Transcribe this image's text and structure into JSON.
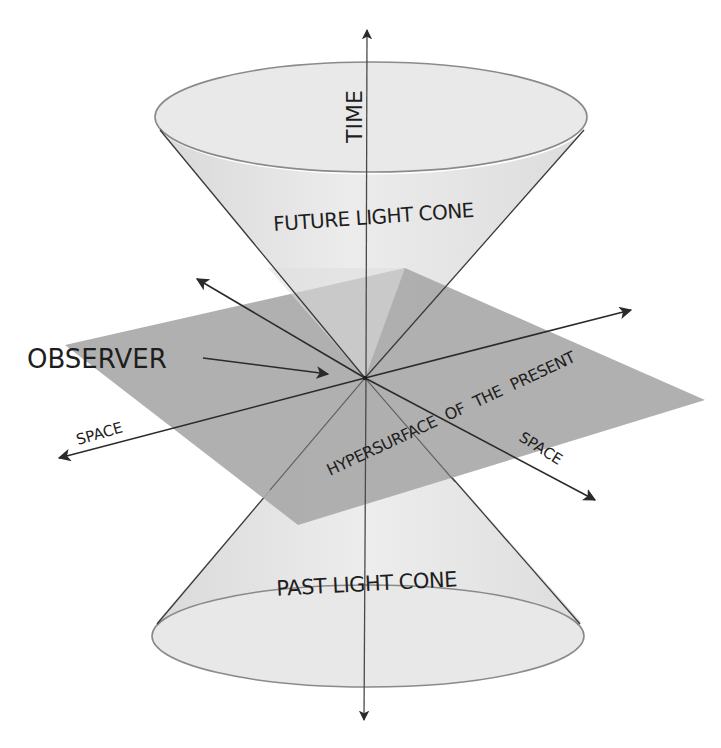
{
  "diagram": {
    "labels": {
      "time": "TIME",
      "future_cone": "FUTURE LIGHT CONE",
      "past_cone": "PAST LIGHT CONE",
      "observer": "OBSERVER",
      "hypersurface": "HYPERSURFACE OF THE PRESENT",
      "space_left": "SPACE",
      "space_right": "SPACE"
    },
    "colors": {
      "background": "#ffffff",
      "cone_fill": "#e6e6e6",
      "cone_rim_fill": "#e9e9e9",
      "hyperplane_fill": "#a9a9a9",
      "line": "#2a2a2a",
      "text": "#1e1e1e"
    },
    "geometry": {
      "apex": [
        365,
        378
      ],
      "time_axis": {
        "top_tip": [
          367,
          28
        ],
        "bottom_tip": [
          364,
          722
        ]
      },
      "future_cone_rim": {
        "cx": 371,
        "cy": 117,
        "rx": 216,
        "ry": 55
      },
      "past_cone_rim": {
        "cx": 368,
        "cy": 636,
        "rx": 216,
        "ry": 51
      },
      "hyperplane_corners": [
        [
          405,
          268
        ],
        [
          705,
          400
        ],
        [
          298,
          525
        ],
        [
          65,
          345
        ]
      ],
      "space_axis_1": {
        "tip_a": [
          57,
          459
        ],
        "tip_b": [
          633,
          309
        ]
      },
      "space_axis_2": {
        "tip_a": [
          195,
          278
        ],
        "tip_b": [
          597,
          501
        ]
      },
      "observer_pointer": {
        "from": [
          203,
          358
        ],
        "to": [
          328,
          374
        ]
      }
    }
  }
}
